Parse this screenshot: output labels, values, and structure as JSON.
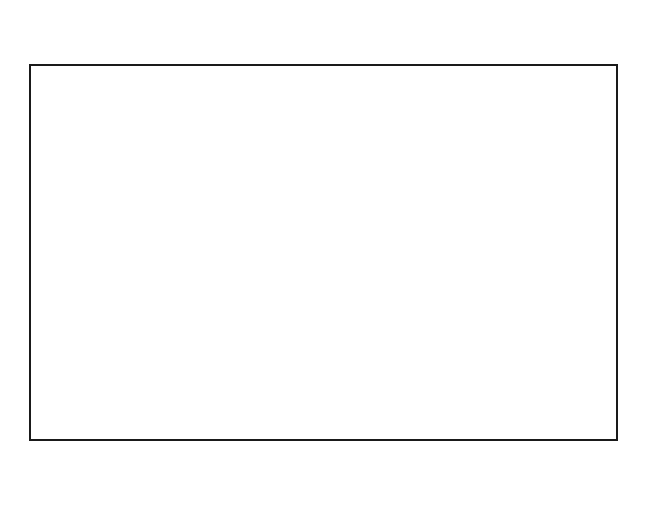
{
  "diagram": {
    "xlabel": "Computing nodes",
    "rows": 9,
    "shade_color": "#8a8a8a",
    "columns": [
      {
        "number": "1",
        "node": "0",
        "shaded": true,
        "x0": 29,
        "x1": 68
      },
      {
        "number": "2",
        "node": "1",
        "shaded": false,
        "x0": 68,
        "x1": 108
      },
      {
        "number": "3",
        "node": "2",
        "shaded": false,
        "x0": 108,
        "x1": 146
      },
      {
        "number": "4",
        "node": "3",
        "shaded": false,
        "x0": 146,
        "x1": 187
      },
      {
        "number": "5",
        "node": "0",
        "shaded": true,
        "x0": 187,
        "x1": 225
      },
      {
        "number": "6",
        "node": "1",
        "shaded": false,
        "x0": 225,
        "x1": 265
      },
      {
        "number": "7",
        "node": "2",
        "shaded": false,
        "x0": 265,
        "x1": 304
      },
      {
        "number": "8",
        "node": "3",
        "shaded": false,
        "x0": 304,
        "x1": 344
      },
      {
        "number": "9",
        "node": "0",
        "shaded": true,
        "x0": 344,
        "x1": 383
      },
      {
        "number": "10",
        "node": "1",
        "shaded": false,
        "x0": 383,
        "x1": 422
      },
      {
        "number": "11",
        "node": "2",
        "shaded": false,
        "x0": 422,
        "x1": 461
      },
      {
        "number": "12",
        "node": "3",
        "shaded": false,
        "x0": 461,
        "x1": 501
      },
      {
        "number": "13",
        "node": "0",
        "shaded": true,
        "x0": 501,
        "x1": 539
      },
      {
        "number": "14",
        "node": "1",
        "shaded": false,
        "x0": 539,
        "x1": 579
      },
      {
        "number": "15",
        "node": "2",
        "shaded": false,
        "x0": 579,
        "x1": 618
      }
    ],
    "row_lines_y": [
      106,
      148,
      190,
      232,
      273,
      315,
      357,
      399
    ]
  }
}
